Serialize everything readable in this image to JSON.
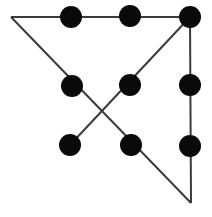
{
  "figure": {
    "type": "dot-grid-polyline",
    "canvas": {
      "width": 212,
      "height": 217,
      "background": "#ffffff"
    },
    "dot_style": {
      "radius": 11,
      "color": "#0a0a0a"
    },
    "line_style": {
      "color": "#3a3a3a",
      "width": 2,
      "cap": "butt",
      "join": "miter"
    },
    "dots": [
      {
        "id": "dot-top-left",
        "row": 1,
        "col": 1,
        "cx": 12,
        "cy": 16,
        "visible": false
      },
      {
        "id": "dot-top-middle",
        "row": 1,
        "col": 2,
        "cx": 71,
        "cy": 17,
        "visible": true
      },
      {
        "id": "dot-top-right",
        "row": 1,
        "col": 3,
        "cx": 130,
        "cy": 16,
        "visible": true
      },
      {
        "id": "dot-middle-left",
        "row": 2,
        "col": 1,
        "cx": 72,
        "cy": 86,
        "visible": true
      },
      {
        "id": "dot-middle-center",
        "row": 2,
        "col": 2,
        "cx": 130,
        "cy": 85,
        "visible": true
      },
      {
        "id": "dot-middle-right",
        "row": 2,
        "col": 3,
        "cx": 190,
        "cy": 85,
        "visible": true
      },
      {
        "id": "dot-bottom-left",
        "row": 3,
        "col": 1,
        "cx": 70,
        "cy": 145,
        "visible": true
      },
      {
        "id": "dot-bottom-middle",
        "row": 3,
        "col": 2,
        "cx": 131,
        "cy": 145,
        "visible": true
      },
      {
        "id": "dot-bottom-right",
        "row": 3,
        "col": 3,
        "cx": 190,
        "cy": 146,
        "visible": true
      },
      {
        "id": "dot-corner-top-right",
        "row": 1,
        "col": 4,
        "cx": 190,
        "cy": 17,
        "visible": true
      }
    ],
    "visible_dot_centers": [
      [
        71,
        17
      ],
      [
        130,
        16
      ],
      [
        190,
        17
      ],
      [
        72,
        86
      ],
      [
        130,
        85
      ],
      [
        190,
        85
      ],
      [
        70,
        145
      ],
      [
        131,
        145
      ],
      [
        190,
        146
      ]
    ],
    "polyline_vertices": [
      [
        11,
        17
      ],
      [
        190,
        17
      ],
      [
        191,
        203
      ],
      [
        11,
        17
      ]
    ],
    "segments": [
      {
        "id": "segment-top-horizontal",
        "from": [
          11,
          17
        ],
        "to": [
          190,
          17
        ],
        "passes_through": [
          "dot-top-middle",
          "dot-top-right",
          "dot-corner-top-right"
        ]
      },
      {
        "id": "segment-right-vertical",
        "from": [
          190,
          17
        ],
        "to": [
          191,
          203
        ],
        "passes_through": [
          "dot-middle-right",
          "dot-bottom-right"
        ]
      },
      {
        "id": "segment-diagonal-up-left",
        "from": [
          191,
          203
        ],
        "to": [
          11,
          17
        ],
        "passes_through": [
          "dot-bottom-middle",
          "dot-middle-left"
        ]
      },
      {
        "id": "segment-diagonal-down-left",
        "from": [
          190,
          17
        ],
        "to": [
          70,
          145
        ],
        "passes_through": [
          "dot-middle-center",
          "dot-bottom-left"
        ]
      }
    ],
    "crossing_points": [
      {
        "id": "crossing-center",
        "x": 101,
        "y": 116
      }
    ]
  }
}
